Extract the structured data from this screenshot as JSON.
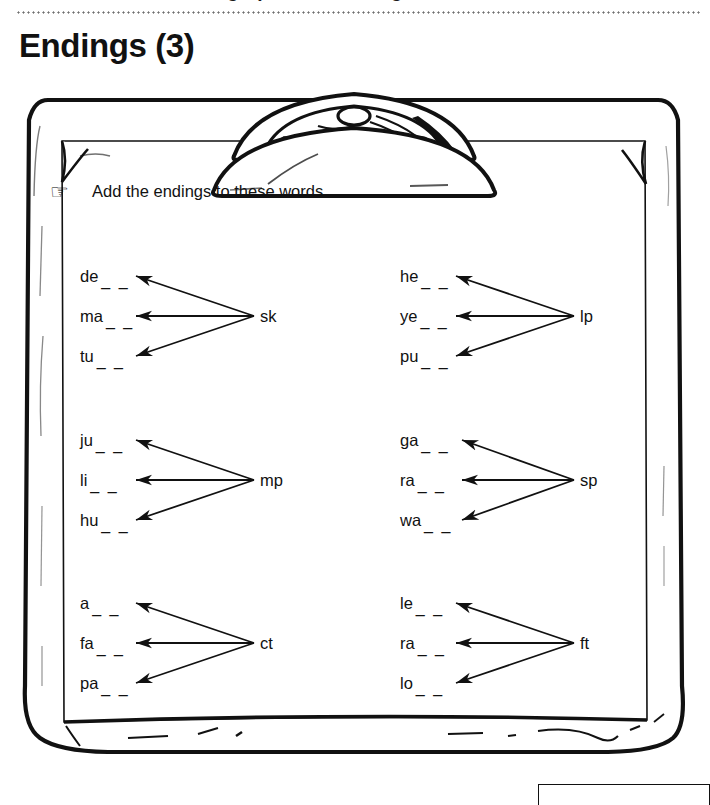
{
  "header": {
    "cut_off_line": "Vowels, Blends, Digraphs and Endings",
    "title": "Endings (3)"
  },
  "instruction": {
    "icon": "pointing-hand-icon",
    "glyph": "☞",
    "text": "Add the endings to these words."
  },
  "worksheet": {
    "groups": [
      {
        "id": "group-1",
        "ending": "sk",
        "words": [
          "de",
          "ma",
          "tu"
        ],
        "blanks": "_ _"
      },
      {
        "id": "group-2",
        "ending": "lp",
        "words": [
          "he",
          "ye",
          "pu"
        ],
        "blanks": "_ _"
      },
      {
        "id": "group-3",
        "ending": "mp",
        "words": [
          "ju",
          "li",
          "hu"
        ],
        "blanks": "_ _"
      },
      {
        "id": "group-4",
        "ending": "sp",
        "words": [
          "ga",
          "ra",
          "wa"
        ],
        "blanks": "_ _"
      },
      {
        "id": "group-5",
        "ending": "ct",
        "words": [
          "a",
          "fa",
          "pa"
        ],
        "blanks": "_ _"
      },
      {
        "id": "group-6",
        "ending": "ft",
        "words": [
          "le",
          "ra",
          "lo"
        ],
        "blanks": "_ _"
      }
    ]
  },
  "colors": {
    "ink": "#111111",
    "rule": "#6f6f6f",
    "paper": "#ffffff"
  }
}
